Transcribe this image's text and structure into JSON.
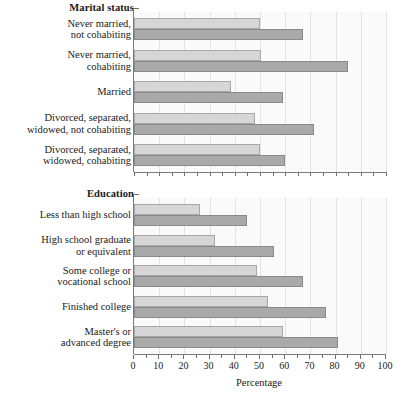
{
  "chart_data": {
    "type": "bar",
    "orientation": "horizontal",
    "title": "",
    "xlabel": "Percentage",
    "ylabel": "",
    "xlim": [
      0,
      100
    ],
    "xticks": [
      0,
      10,
      20,
      30,
      40,
      50,
      60,
      70,
      80,
      90,
      100
    ],
    "grid": true,
    "legend": "none",
    "colors": {
      "light_series": "#d6d6d6",
      "dark_series": "#a9a9a9",
      "axis": "#7a7a7a",
      "grid": "#e2e2e2"
    },
    "panels": [
      {
        "title": "Marital status",
        "categories": [
          "Never married,\nnot cohabiting",
          "Never married,\ncohabiting",
          "Married",
          "Divorced, separated,\nwidowed, not cohabiting",
          "Divorced, separated,\nwidowed, cohabiting"
        ],
        "series": [
          {
            "name": "light",
            "values": [
              50,
              50.5,
              38.5,
              48,
              50
            ]
          },
          {
            "name": "dark",
            "values": [
              67,
              85,
              59,
              71.5,
              60
            ]
          }
        ]
      },
      {
        "title": "Education",
        "categories": [
          "Less than high school",
          "High school graduate\nor equivalent",
          "Some college or\nvocational school",
          "Finished college",
          "Master's or\nadvanced degree"
        ],
        "series": [
          {
            "name": "light",
            "values": [
              26,
              32,
              49,
              53,
              59
            ]
          },
          {
            "name": "dark",
            "values": [
              45,
              55.5,
              67,
              76,
              81
            ]
          }
        ]
      }
    ]
  }
}
